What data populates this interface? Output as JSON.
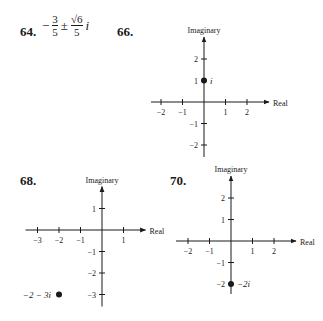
{
  "problems": [
    {
      "number": "64.",
      "answer": {
        "sign": "−",
        "real_num": "3",
        "real_den": "5",
        "pm": "±",
        "imag_num": "√6",
        "imag_den": "5",
        "unit": "i"
      }
    },
    {
      "number": "66."
    },
    {
      "number": "68."
    },
    {
      "number": "70."
    }
  ],
  "chart_data": [
    {
      "problem": "66",
      "type": "scatter",
      "xlabel": "Real",
      "ylabel": "Imaginary",
      "xlim": [
        -2,
        2
      ],
      "ylim": [
        -2,
        2
      ],
      "x_ticks": [
        "−2",
        "−1",
        "1",
        "2"
      ],
      "y_ticks": [
        "2",
        "1",
        "−1",
        "−2"
      ],
      "points": [
        {
          "x": 0,
          "y": 1,
          "label": "i"
        }
      ]
    },
    {
      "problem": "68",
      "type": "scatter",
      "xlabel": "Real",
      "ylabel": "Imaginary",
      "xlim": [
        -3,
        1
      ],
      "ylim": [
        -3,
        1
      ],
      "x_ticks": [
        "−3",
        "−2",
        "−1",
        "1"
      ],
      "y_ticks": [
        "1",
        "−1",
        "−2",
        "−3"
      ],
      "points": [
        {
          "x": -2,
          "y": -3,
          "label": "−2 − 3i"
        }
      ]
    },
    {
      "problem": "70",
      "type": "scatter",
      "xlabel": "Real",
      "ylabel": "Imaginary",
      "xlim": [
        -2,
        2
      ],
      "ylim": [
        -2,
        2
      ],
      "x_ticks": [
        "−2",
        "−1",
        "1",
        "2"
      ],
      "y_ticks": [
        "2",
        "1",
        "−1",
        "−2"
      ],
      "points": [
        {
          "x": 0,
          "y": -2,
          "label": "−2i"
        }
      ]
    }
  ]
}
